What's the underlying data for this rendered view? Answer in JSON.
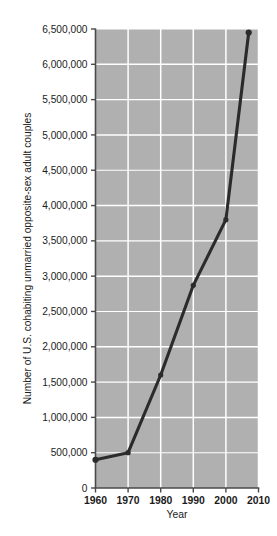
{
  "figure": {
    "background_color": "#ffffff",
    "plot_background_color": "#b0b0b0",
    "gridline_color": "#ffffff",
    "line_color": "#2b2b2b",
    "axis_color": "#4a4a4a",
    "caption": ""
  },
  "chart_data": {
    "type": "line",
    "title": "",
    "xlabel": "Year",
    "ylabel": "Number of U.S. cohabiting unmarried opposite-sex adult couples",
    "xlim": [
      1960,
      2010
    ],
    "ylim": [
      0,
      6500000
    ],
    "grid": true,
    "legend": "none",
    "x_ticks": [
      "1960",
      "1970",
      "1980",
      "1990",
      "2000",
      "2010"
    ],
    "x_tick_values": [
      1960,
      1970,
      1980,
      1990,
      2000,
      2010
    ],
    "y_ticks": [
      "0",
      "500,000",
      "1,000,000",
      "1,500,000",
      "2,000,000",
      "2,500,000",
      "3,000,000",
      "3,500,000",
      "4,000,000",
      "4,500,000",
      "5,000,000",
      "5,500,000",
      "6,000,000",
      "6,500,000"
    ],
    "y_tick_values": [
      0,
      500000,
      1000000,
      1500000,
      2000000,
      2500000,
      3000000,
      3500000,
      4000000,
      4500000,
      5000000,
      5500000,
      6000000,
      6500000
    ],
    "series": [
      {
        "name": "Cohabiting unmarried opposite-sex adult couples",
        "x": [
          1960,
          1970,
          1980,
          1990,
          2000,
          2007
        ],
        "values": [
          400000,
          500000,
          1600000,
          2870000,
          3800000,
          6450000
        ],
        "marker": "circle",
        "color": "#2b2b2b"
      }
    ]
  }
}
